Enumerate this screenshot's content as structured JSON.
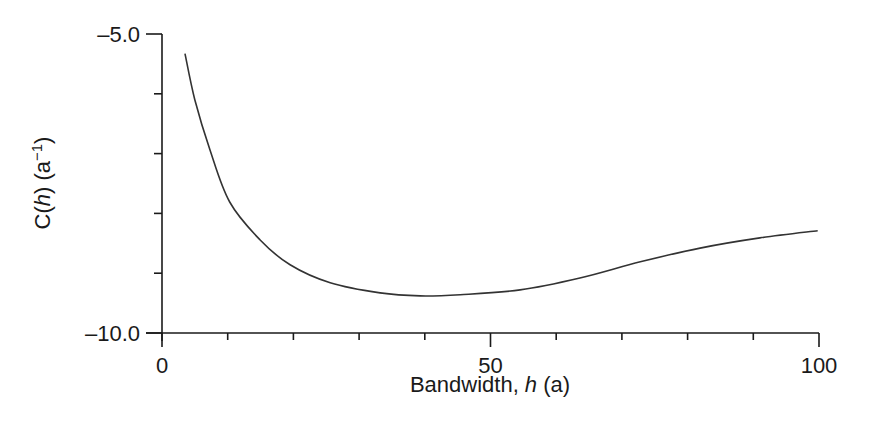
{
  "chart_data": {
    "type": "line",
    "title": "",
    "xlabel": "Bandwidth, h (a)",
    "ylabel": "C(h) (a⁻¹)",
    "xlim": [
      0,
      100
    ],
    "ylim": [
      -10.0,
      -5.0
    ],
    "x_ticks_major": [
      0,
      50,
      100
    ],
    "x_tick_labels": [
      "0",
      "50",
      "100"
    ],
    "x_ticks_minor": [
      10,
      20,
      30,
      40,
      60,
      70,
      80,
      90
    ],
    "y_ticks_major": [
      -5.0,
      -10.0
    ],
    "y_tick_labels": [
      "–5.0",
      "–10.0"
    ],
    "y_ticks_minor": [
      -6,
      -7,
      -8,
      -9
    ],
    "grid": false,
    "legend": null,
    "series": [
      {
        "name": "C(h)",
        "color": "#333333",
        "x": [
          3.5,
          5.0,
          7.3,
          10.3,
          14.9,
          19.5,
          25.6,
          33.2,
          39.3,
          45.4,
          54.5,
          63.6,
          72.8,
          81.9,
          91.0,
          99.8
        ],
        "y": [
          -5.33,
          -6.1,
          -6.94,
          -7.81,
          -8.44,
          -8.86,
          -9.16,
          -9.33,
          -9.38,
          -9.36,
          -9.28,
          -9.08,
          -8.81,
          -8.58,
          -8.41,
          -8.29
        ]
      }
    ]
  },
  "labels": {
    "x_axis_prefix": "Bandwidth, ",
    "x_axis_var": "h",
    "x_axis_suffix": " (a)",
    "y_axis_c": "C(",
    "y_axis_var": "h",
    "y_axis_mid": ") (a",
    "y_axis_sup": "−1",
    "y_axis_end": ")"
  }
}
